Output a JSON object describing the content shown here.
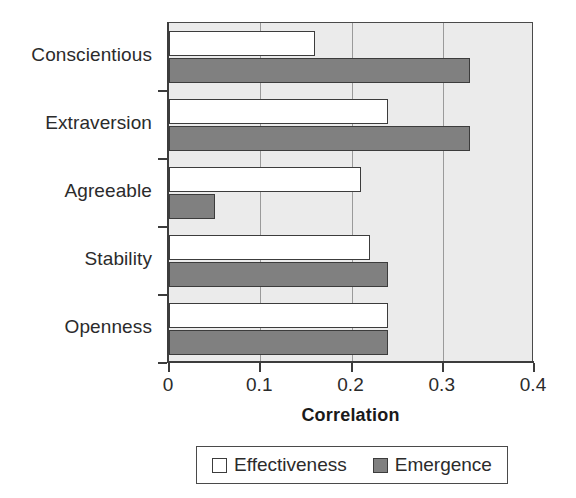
{
  "chart_data": {
    "type": "bar",
    "orientation": "horizontal",
    "title": "",
    "xlabel": "Correlation",
    "ylabel": "",
    "xlim": [
      0,
      0.4
    ],
    "xticks": [
      "0",
      "0.1",
      "0.2",
      "0.3",
      "0.4"
    ],
    "xtick_values": [
      0,
      0.1,
      0.2,
      0.3,
      0.4
    ],
    "grid": "vertical",
    "legend_position": "bottom",
    "categories": [
      "Conscientious",
      "Extraversion",
      "Agreeable",
      "Stability",
      "Openness"
    ],
    "series": [
      {
        "name": "Effectiveness",
        "color": "#ffffff",
        "values": [
          0.16,
          0.24,
          0.21,
          0.22,
          0.24
        ]
      },
      {
        "name": "Emergence",
        "color": "#808080",
        "values": [
          0.33,
          0.33,
          0.05,
          0.24,
          0.24
        ]
      }
    ]
  },
  "axis": {
    "x_title": "Correlation"
  },
  "legend": {
    "items": [
      {
        "label": "Effectiveness",
        "swatch": "white-square-icon"
      },
      {
        "label": "Emergence",
        "swatch": "gray-square-icon"
      }
    ]
  }
}
